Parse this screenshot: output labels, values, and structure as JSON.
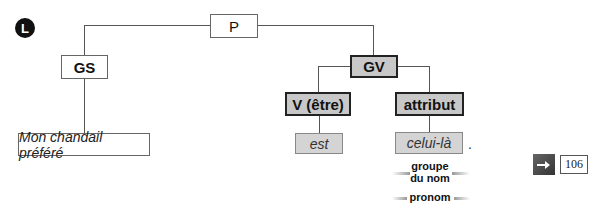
{
  "marker": {
    "letter": "L"
  },
  "tree": {
    "root": "P",
    "gs": "GS",
    "gv": "GV",
    "verb": "V (être)",
    "attribut": "attribut",
    "subject_words": "Mon chandail préféré",
    "verb_word": "est",
    "attribut_word": "celui-là",
    "period": "."
  },
  "annotations": {
    "groupe_line1": "groupe",
    "groupe_line2": "du nom",
    "pronom": "pronom"
  },
  "reference": {
    "icon": "arrow-right-icon",
    "page": "106"
  }
}
